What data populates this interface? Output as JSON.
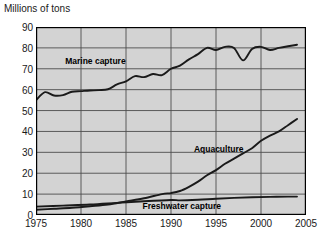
{
  "chart_data": {
    "type": "line",
    "title": "",
    "ylabel": "Millions of tons",
    "xlabel": "",
    "xlim": [
      1975,
      2005
    ],
    "ylim": [
      0,
      90
    ],
    "grid": true,
    "legend_position": "inline-annotations",
    "plot_background": "#d3d3d3",
    "grid_color": "#4d4d4d",
    "line_color": "#1a1a1a",
    "frame_color": "#000000",
    "y_ticks": [
      "0",
      "10",
      "20",
      "30",
      "40",
      "50",
      "60",
      "70",
      "80",
      "90"
    ],
    "x_ticks": [
      "1975",
      "1980",
      "1985",
      "1990",
      "1995",
      "2000",
      "2005"
    ],
    "annotations": [
      {
        "name": "marine-capture-label",
        "text": "Marine capture",
        "x": 1981.6,
        "y": 73.5
      },
      {
        "name": "aquaculture-label",
        "text": "Aquaculture",
        "x": 1995.3,
        "y": 31.5
      },
      {
        "name": "freshwater-capture-label",
        "text": "Freshwater capture",
        "x": 1991.2,
        "y": 4.2
      }
    ],
    "series": [
      {
        "name": "Marine capture",
        "x": [
          1975,
          1976,
          1977,
          1978,
          1979,
          1980,
          1981,
          1982,
          1983,
          1984,
          1985,
          1986,
          1987,
          1988,
          1989,
          1990,
          1991,
          1992,
          1993,
          1994,
          1995,
          1996,
          1997,
          1998,
          1999,
          2000,
          2001,
          2002,
          2003,
          2004
        ],
        "values": [
          55.0,
          58.8,
          57.2,
          57.4,
          59.0,
          59.3,
          59.6,
          59.8,
          60.2,
          62.5,
          64.0,
          66.5,
          66.0,
          67.5,
          67.0,
          70.0,
          71.5,
          74.5,
          77.0,
          80.0,
          79.0,
          80.5,
          80.0,
          74.0,
          79.5,
          80.5,
          79.0,
          80.0,
          80.8,
          81.5
        ]
      },
      {
        "name": "Aquaculture",
        "x": [
          1975,
          1977,
          1979,
          1981,
          1983,
          1985,
          1987,
          1989,
          1990,
          1991,
          1992,
          1993,
          1994,
          1995,
          1996,
          1997,
          1998,
          1999,
          2000,
          2001,
          2002,
          2003,
          2004
        ],
        "values": [
          2.5,
          3.0,
          3.5,
          4.2,
          5.0,
          6.5,
          8.0,
          10.0,
          10.5,
          11.5,
          13.5,
          16.0,
          19.0,
          21.5,
          24.5,
          27.0,
          29.5,
          32.0,
          35.5,
          38.0,
          40.0,
          43.0,
          46.0
        ]
      },
      {
        "name": "Freshwater capture",
        "x": [
          1975,
          1978,
          1981,
          1984,
          1987,
          1990,
          1991,
          1993,
          1995,
          1997,
          1999,
          2001,
          2003,
          2004
        ],
        "values": [
          4.0,
          4.5,
          5.0,
          5.8,
          6.6,
          7.2,
          7.0,
          7.3,
          7.8,
          8.2,
          8.5,
          8.7,
          8.8,
          8.8
        ]
      }
    ]
  }
}
